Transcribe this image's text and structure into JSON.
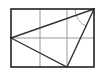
{
  "diagram": {
    "type": "geometry-figure",
    "colors": {
      "outer": "#222222",
      "grid": "#9a9a9a",
      "triangle": "#333333",
      "arc": "#aaaaaa",
      "background": "#ffffff"
    },
    "rectangle": {
      "x": 11,
      "y": 9,
      "width": 83,
      "height": 58
    },
    "grid": {
      "vertical_lines_x": [
        40,
        67
      ],
      "horizontal_lines_y": [
        38
      ]
    },
    "triangle": {
      "vertices": [
        [
          11,
          38
        ],
        [
          94,
          9
        ],
        [
          67,
          67
        ]
      ]
    },
    "angle_arc": {
      "vertex": [
        94,
        9
      ],
      "radius": 19
    }
  }
}
